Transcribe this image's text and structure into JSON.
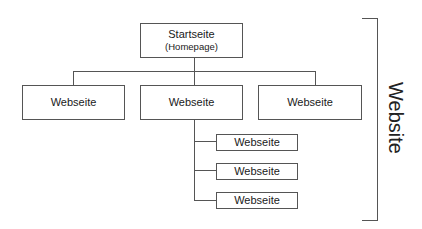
{
  "diagram": {
    "root": {
      "title": "Startseite",
      "subtitle": "(Homepage)"
    },
    "level2": [
      {
        "label": "Webseite"
      },
      {
        "label": "Webseite"
      },
      {
        "label": "Webseite"
      }
    ],
    "children_of_middle": [
      {
        "label": "Webseite"
      },
      {
        "label": "Webseite"
      },
      {
        "label": "Webseite"
      }
    ],
    "bracket_label": "Website",
    "line_color": "#555555"
  }
}
